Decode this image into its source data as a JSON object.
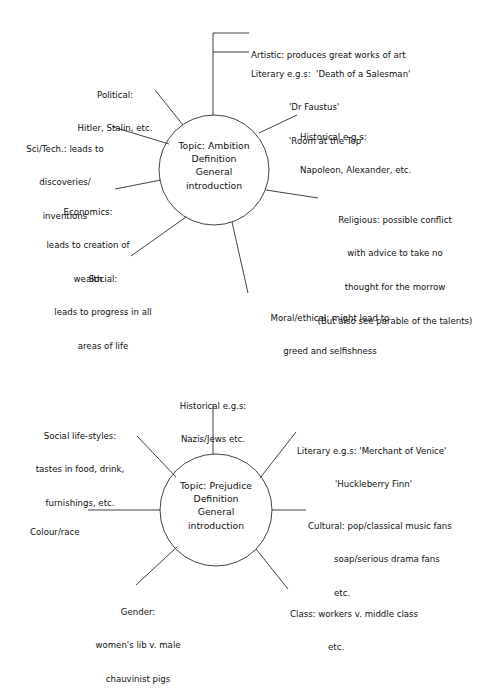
{
  "page": {
    "background": "#ffffff",
    "ink": "#2b2b2b",
    "width": 490,
    "height": 637
  },
  "diagrams": [
    {
      "id": "ambition-mind-map",
      "hub": {
        "line1": "Topic: Ambition",
        "line2": "Definition",
        "line3": "General",
        "line4": "introduction"
      },
      "branches": [
        {
          "name": "artistic",
          "lines": [
            "Artistic: produces great works of art"
          ]
        },
        {
          "name": "literary",
          "lines": [
            "Literary e.g.s:  'Death of a Salesman'",
            "'Dr Faustus'",
            "'Room at the Top'"
          ]
        },
        {
          "name": "historical",
          "lines": [
            "Historical e.g.s:",
            "Napoleon, Alexander, etc."
          ]
        },
        {
          "name": "religious",
          "lines": [
            "Religious: possible conflict",
            "with advice to take no",
            "thought for the morrow",
            "(But also see parable of the talents)"
          ]
        },
        {
          "name": "moral-ethical",
          "lines": [
            "Moral/ethical: might lead to",
            "greed and selfishness"
          ]
        },
        {
          "name": "social",
          "lines": [
            "Social:",
            "leads to progress in all",
            "areas of life"
          ]
        },
        {
          "name": "economics",
          "lines": [
            "Economics:",
            "leads to creation of",
            "wealth"
          ]
        },
        {
          "name": "sci-tech",
          "lines": [
            "Sci/Tech.: leads to",
            "discoveries/",
            "inventions"
          ]
        },
        {
          "name": "political",
          "lines": [
            "Political:",
            "Hitler, Stalin, etc."
          ]
        }
      ]
    },
    {
      "id": "prejudice-mind-map",
      "hub": {
        "line1": "Topic: Prejudice",
        "line2": "Definition",
        "line3": "General",
        "line4": "introduction"
      },
      "branches": [
        {
          "name": "historical",
          "lines": [
            "Historical e.g.s:",
            "Nazis/Jews etc."
          ]
        },
        {
          "name": "literary",
          "lines": [
            "Literary e.g.s: 'Merchant of Venice'",
            "'Huckleberry Finn'"
          ]
        },
        {
          "name": "cultural",
          "lines": [
            "Cultural: pop/classical music fans",
            "soap/serious drama fans",
            "etc."
          ]
        },
        {
          "name": "class",
          "lines": [
            "Class: workers v. middle class",
            "etc."
          ]
        },
        {
          "name": "gender",
          "lines": [
            "Gender:",
            "women's lib v. male",
            "chauvinist pigs"
          ]
        },
        {
          "name": "colour-race",
          "lines": [
            "Colour/race"
          ]
        },
        {
          "name": "social-life-styles",
          "lines": [
            "Social life-styles:",
            "tastes in food, drink,",
            "furnishings, etc."
          ]
        }
      ]
    }
  ]
}
